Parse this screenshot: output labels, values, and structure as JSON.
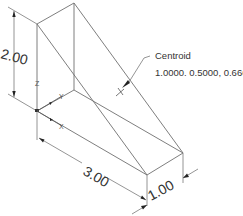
{
  "drawing": {
    "type": "isometric wedge part",
    "dimensions": {
      "height": "2.00",
      "length": "3.00",
      "width": "1.00"
    },
    "centroid": {
      "label": "Centroid",
      "coordinates": "1.0000. 0.5000, 0.6667"
    },
    "axes": {
      "x": "X",
      "y": "Y",
      "z": "Z"
    },
    "colors": {
      "line": "#6f6f6f",
      "text": "#333333",
      "background": "#ffffff"
    }
  }
}
